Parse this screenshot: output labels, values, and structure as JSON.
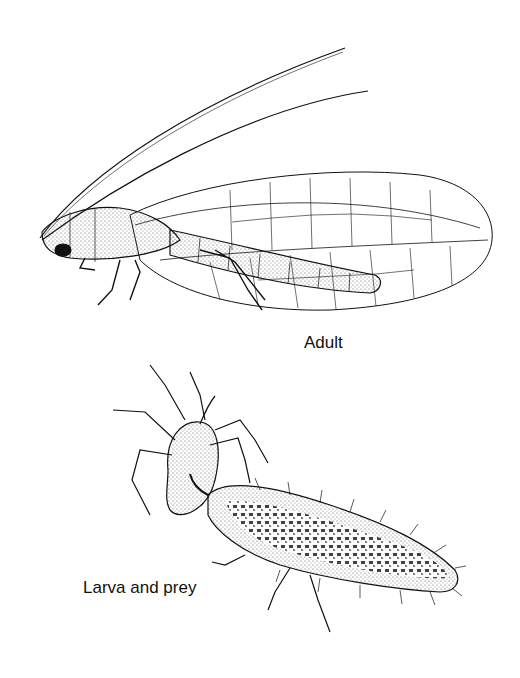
{
  "figure": {
    "labels": {
      "adult": "Adult",
      "larva": "Larva and prey"
    },
    "colors": {
      "ink": "#111111",
      "background": "#ffffff",
      "stipple": "#555555"
    }
  }
}
